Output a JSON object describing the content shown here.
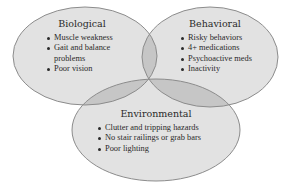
{
  "diagram": {
    "type": "venn",
    "colors": {
      "fill": "#e2e2e2",
      "overlap": "#c6c6c6",
      "stroke": "#8c8c8c",
      "text": "#2a2a2a"
    },
    "sets": [
      {
        "id": "biological",
        "title": "Biological",
        "items": [
          "Muscle weakness",
          "Gait and balance",
          "problems",
          "Poor vision"
        ]
      },
      {
        "id": "behavioral",
        "title": "Behavioral",
        "items": [
          "Risky behaviors",
          "4+ medications",
          "Psychoactive meds",
          "Inactivity"
        ]
      },
      {
        "id": "environmental",
        "title": "Environmental",
        "items": [
          "Clutter and tripping hazards",
          "No stair railings or grab bars",
          "Poor lighting"
        ]
      }
    ]
  }
}
